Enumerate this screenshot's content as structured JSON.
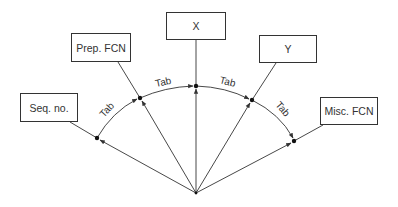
{
  "diagram": {
    "boxes": [
      {
        "id": "seq",
        "label": "Seq. no.",
        "x": 20,
        "y": 93,
        "w": 58,
        "h": 29
      },
      {
        "id": "prep",
        "label": "Prep. FCN",
        "x": 71,
        "y": 33,
        "w": 60,
        "h": 29
      },
      {
        "id": "x",
        "label": "X",
        "x": 166,
        "y": 12,
        "w": 60,
        "h": 28
      },
      {
        "id": "y",
        "label": "Y",
        "x": 259,
        "y": 35,
        "w": 58,
        "h": 28
      },
      {
        "id": "misc",
        "label": "Misc. FCN",
        "x": 320,
        "y": 97,
        "w": 58,
        "h": 28
      }
    ],
    "tab_label": "Tab",
    "tabs": [
      "Tab",
      "Tab",
      "Tab",
      "Tab"
    ],
    "origin": {
      "x": 196,
      "y": 193
    },
    "points": [
      {
        "x": 97,
        "y": 138
      },
      {
        "x": 140,
        "y": 98
      },
      {
        "x": 196,
        "y": 86
      },
      {
        "x": 252,
        "y": 100
      },
      {
        "x": 294,
        "y": 141
      }
    ],
    "colors": {
      "line": "#333333",
      "text": "#333333",
      "background": "#ffffff"
    }
  }
}
